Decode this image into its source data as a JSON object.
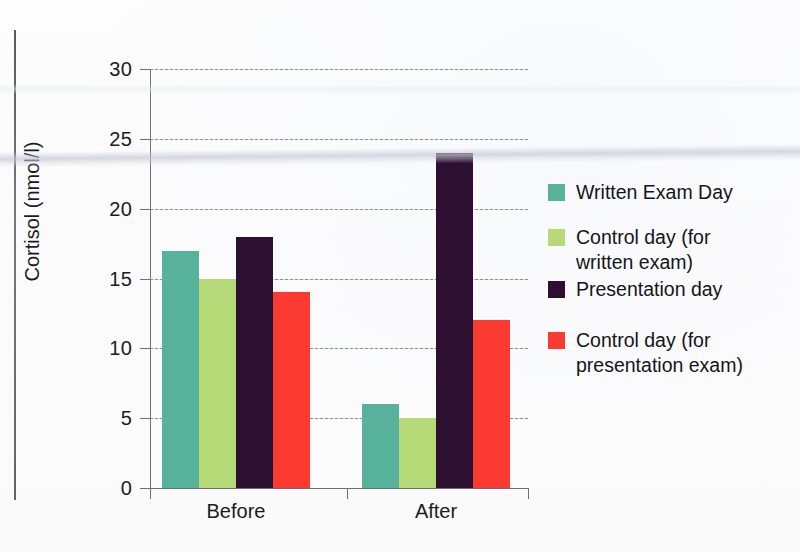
{
  "chart_data": {
    "type": "bar",
    "title": "",
    "xlabel": "",
    "ylabel": "Cortisol (nmol/l)",
    "categories": [
      "Before",
      "After"
    ],
    "ylim": [
      0,
      30
    ],
    "yticks": [
      0,
      5,
      10,
      15,
      20,
      25,
      30
    ],
    "grid": true,
    "legend_position": "right",
    "series": [
      {
        "name": "Written Exam Day",
        "color": "#58b19b",
        "values": [
          17,
          6
        ]
      },
      {
        "name": "Control day (for written exam)",
        "color": "#b6da78",
        "values": [
          15,
          5
        ]
      },
      {
        "name": "Presentation day",
        "color": "#2c0f31",
        "values": [
          18,
          24
        ]
      },
      {
        "name": "Control day (for presentation exam)",
        "color": "#fb3a31",
        "values": [
          14,
          12
        ]
      }
    ]
  },
  "legend": {
    "entries": [
      {
        "label": "Written Exam Day"
      },
      {
        "label": "Control day (for\nwritten exam)"
      },
      {
        "label": "Presentation day"
      },
      {
        "label": "Control day (for\npresentation exam)"
      }
    ]
  },
  "axis": {
    "y_tick_labels": [
      "30",
      "25",
      "20",
      "15",
      "10",
      "5",
      "0"
    ],
    "x_tick_labels": [
      "Before",
      "After"
    ]
  }
}
